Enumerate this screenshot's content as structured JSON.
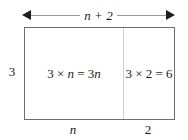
{
  "diagram": {
    "type": "area-model-rectangle",
    "top_dimension": {
      "label": "n + 2",
      "arrow": "double-headed-horizontal-arrow"
    },
    "left_dimension": {
      "label": "3"
    },
    "bottom_dimensions": [
      {
        "label": "n"
      },
      {
        "label": "2"
      }
    ],
    "cells": [
      {
        "expression_prefix": "3 × ",
        "expression_var": "n",
        "expression_equals": " = 3",
        "expression_result_var": "n",
        "full_text": "3 × n = 3n"
      },
      {
        "full_text": "3 × 2 = 6"
      }
    ],
    "colors": {
      "border": "#6e6e6e",
      "divider": "#cfcfcf",
      "arrow_line": "#9a9a9a",
      "arrowhead": "#1f1f1f",
      "text": "#1a1a1a",
      "background": "#ffffff"
    }
  }
}
